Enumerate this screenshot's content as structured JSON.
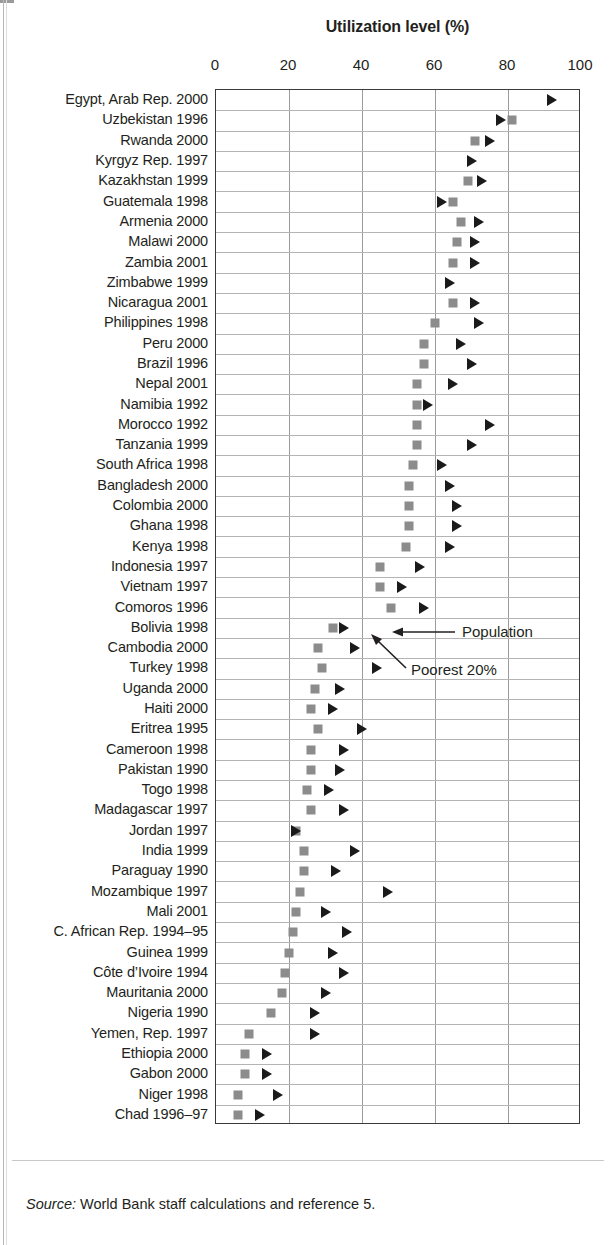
{
  "chart_data": {
    "type": "scatter",
    "title": "Utilization level (%)",
    "xlabel": "Utilization level (%)",
    "ylabel": "",
    "xlim": [
      0,
      100
    ],
    "xticks": [
      0,
      20,
      40,
      60,
      80,
      100
    ],
    "grid": true,
    "legend_position": "inline-annotation",
    "series": [
      {
        "name": "Poorest 20%",
        "marker": "square",
        "color": "#8c8c8c"
      },
      {
        "name": "Population",
        "marker": "triangle",
        "color": "#1a1a1a"
      }
    ],
    "categories": [
      "Egypt, Arab Rep. 2000",
      "Uzbekistan 1996",
      "Rwanda 2000",
      "Kyrgyz Rep. 1997",
      "Kazakhstan 1999",
      "Guatemala 1998",
      "Armenia 2000",
      "Malawi 2000",
      "Zambia 2001",
      "Zimbabwe 1999",
      "Nicaragua 2001",
      "Philippines 1998",
      "Peru 2000",
      "Brazil 1996",
      "Nepal 2001",
      "Namibia 1992",
      "Morocco 1992",
      "Tanzania 1999",
      "South Africa 1998",
      "Bangladesh 2000",
      "Colombia 2000",
      "Ghana 1998",
      "Kenya 1998",
      "Indonesia 1997",
      "Vietnam 1997",
      "Comoros 1996",
      "Bolivia 1998",
      "Cambodia 2000",
      "Turkey 1998",
      "Uganda 2000",
      "Haiti 2000",
      "Eritrea 1995",
      "Cameroon 1998",
      "Pakistan 1990",
      "Togo 1998",
      "Madagascar 1997",
      "Jordan 1997",
      "India 1999",
      "Paraguay 1990",
      "Mozambique 1997",
      "Mali 2001",
      "C. African Rep. 1994–95",
      "Guinea 1999",
      "Côte d’Ivoire 1994",
      "Mauritania 2000",
      "Nigeria 1990",
      "Yemen, Rep. 1997",
      "Ethiopia 2000",
      "Gabon 2000",
      "Niger 1998",
      "Chad 1996–97"
    ],
    "rows": [
      {
        "label": "Egypt, Arab Rep. 2000",
        "poorest20": null,
        "population": 92
      },
      {
        "label": "Uzbekistan 1996",
        "poorest20": 81,
        "population": 78
      },
      {
        "label": "Rwanda 2000",
        "poorest20": 71,
        "population": 75
      },
      {
        "label": "Kyrgyz Rep. 1997",
        "poorest20": null,
        "population": 70
      },
      {
        "label": "Kazakhstan 1999",
        "poorest20": 69,
        "population": 73
      },
      {
        "label": "Guatemala 1998",
        "poorest20": 65,
        "population": 62
      },
      {
        "label": "Armenia 2000",
        "poorest20": 67,
        "population": 72
      },
      {
        "label": "Malawi 2000",
        "poorest20": 66,
        "population": 71
      },
      {
        "label": "Zambia 2001",
        "poorest20": 65,
        "population": 71
      },
      {
        "label": "Zimbabwe 1999",
        "poorest20": null,
        "population": 64
      },
      {
        "label": "Nicaragua 2001",
        "poorest20": 65,
        "population": 71
      },
      {
        "label": "Philippines 1998",
        "poorest20": 60,
        "population": 72
      },
      {
        "label": "Peru 2000",
        "poorest20": 57,
        "population": 67
      },
      {
        "label": "Brazil 1996",
        "poorest20": 57,
        "population": 70
      },
      {
        "label": "Nepal 2001",
        "poorest20": 55,
        "population": 65
      },
      {
        "label": "Namibia 1992",
        "poorest20": 55,
        "population": 58
      },
      {
        "label": "Morocco 1992",
        "poorest20": 55,
        "population": 75
      },
      {
        "label": "Tanzania 1999",
        "poorest20": 55,
        "population": 70
      },
      {
        "label": "South Africa 1998",
        "poorest20": 54,
        "population": 62
      },
      {
        "label": "Bangladesh 2000",
        "poorest20": 53,
        "population": 64
      },
      {
        "label": "Colombia 2000",
        "poorest20": 53,
        "population": 66
      },
      {
        "label": "Ghana 1998",
        "poorest20": 53,
        "population": 66
      },
      {
        "label": "Kenya 1998",
        "poorest20": 52,
        "population": 64
      },
      {
        "label": "Indonesia 1997",
        "poorest20": 45,
        "population": 56
      },
      {
        "label": "Vietnam 1997",
        "poorest20": 45,
        "population": 51
      },
      {
        "label": "Comoros 1996",
        "poorest20": 48,
        "population": 57
      },
      {
        "label": "Bolivia 1998",
        "poorest20": 32,
        "population": 35
      },
      {
        "label": "Cambodia 2000",
        "poorest20": 28,
        "population": 38
      },
      {
        "label": "Turkey 1998",
        "poorest20": 29,
        "population": 44
      },
      {
        "label": "Uganda 2000",
        "poorest20": 27,
        "population": 34
      },
      {
        "label": "Haiti 2000",
        "poorest20": 26,
        "population": 32
      },
      {
        "label": "Eritrea 1995",
        "poorest20": 28,
        "population": 40
      },
      {
        "label": "Cameroon 1998",
        "poorest20": 26,
        "population": 35
      },
      {
        "label": "Pakistan 1990",
        "poorest20": 26,
        "population": 34
      },
      {
        "label": "Togo 1998",
        "poorest20": 25,
        "population": 31
      },
      {
        "label": "Madagascar 1997",
        "poorest20": 26,
        "population": 35
      },
      {
        "label": "Jordan 1997",
        "poorest20": 22,
        "population": 22
      },
      {
        "label": "India 1999",
        "poorest20": 24,
        "population": 38
      },
      {
        "label": "Paraguay 1990",
        "poorest20": 24,
        "population": 33
      },
      {
        "label": "Mozambique 1997",
        "poorest20": 23,
        "population": 47
      },
      {
        "label": "Mali 2001",
        "poorest20": 22,
        "population": 30
      },
      {
        "label": "C. African Rep. 1994–95",
        "poorest20": 21,
        "population": 36
      },
      {
        "label": "Guinea 1999",
        "poorest20": 20,
        "population": 32
      },
      {
        "label": "Côte d’Ivoire 1994",
        "poorest20": 19,
        "population": 35
      },
      {
        "label": "Mauritania 2000",
        "poorest20": 18,
        "population": 30
      },
      {
        "label": "Nigeria 1990",
        "poorest20": 15,
        "population": 27
      },
      {
        "label": "Yemen, Rep. 1997",
        "poorest20": 9,
        "population": 27
      },
      {
        "label": "Ethiopia 2000",
        "poorest20": 8,
        "population": 14
      },
      {
        "label": "Gabon 2000",
        "poorest20": 8,
        "population": 14
      },
      {
        "label": "Niger 1998",
        "poorest20": 6,
        "population": 17
      },
      {
        "label": "Chad 1996–97",
        "poorest20": 6,
        "population": 12
      }
    ],
    "annotations": [
      {
        "id": "population-annotation",
        "text": "Population"
      },
      {
        "id": "poorest20-annotation",
        "text": "Poorest 20%"
      }
    ]
  },
  "footer": {
    "source_label": "Source:",
    "source_text": " World Bank staff calculations and reference 5."
  }
}
